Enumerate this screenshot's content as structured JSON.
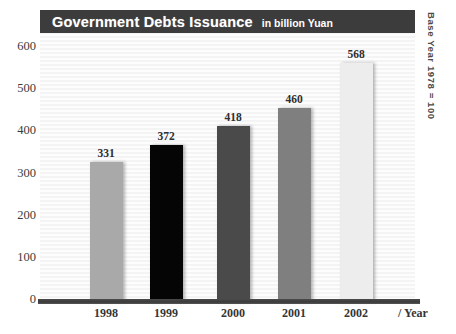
{
  "chart_data": {
    "type": "bar",
    "title": "Government Debts Issuance",
    "subtitle": "in billion Yuan",
    "annotation": "Base Year 1978 = 100",
    "xlabel": "/ Year",
    "ylabel": "",
    "categories": [
      "1998",
      "1999",
      "2000",
      "2001",
      "2002"
    ],
    "values": [
      331,
      372,
      418,
      460,
      568
    ],
    "value_labels": [
      "331",
      "372",
      "418",
      "460",
      "568"
    ],
    "ylim": [
      0,
      600
    ],
    "yticks": [
      600,
      500,
      400,
      300,
      200,
      100,
      0
    ],
    "ytick_labels": [
      "600",
      "500",
      "400",
      "300",
      "200",
      "100",
      "0"
    ],
    "grid": false,
    "legend": null,
    "series": [
      {
        "name": "Government debt issuance",
        "values": [
          331,
          372,
          418,
          460,
          568
        ],
        "bar_colors": [
          "#a9a9a9",
          "#050505",
          "#4a4a4a",
          "#7f7f7f",
          "#ededed"
        ]
      }
    ],
    "colors": {
      "title_bar": "#3c3c3c",
      "title_text": "#ffffff",
      "axis": "#3a3a3a",
      "plot_background": "#f8f8f8",
      "label_text": "#2e2e2e"
    }
  }
}
